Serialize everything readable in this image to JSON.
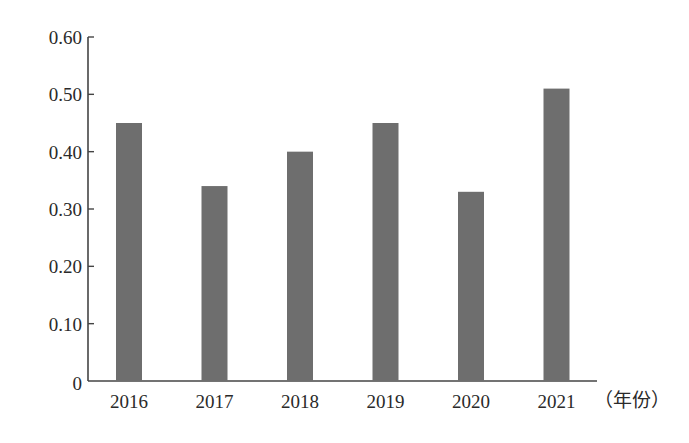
{
  "chart_data": {
    "type": "bar",
    "title": "",
    "xlabel": "（年份）",
    "ylabel": "",
    "categories": [
      "2016",
      "2017",
      "2018",
      "2019",
      "2020",
      "2021"
    ],
    "values": [
      0.45,
      0.34,
      0.4,
      0.45,
      0.33,
      0.51
    ],
    "ylim": [
      0,
      0.6
    ],
    "yticks": [
      "0",
      "0.10",
      "0.20",
      "0.30",
      "0.40",
      "0.50",
      "0.60"
    ],
    "grid": false,
    "legend": null,
    "bar_color": "#6e6e6e",
    "axis_color": "#444444"
  }
}
